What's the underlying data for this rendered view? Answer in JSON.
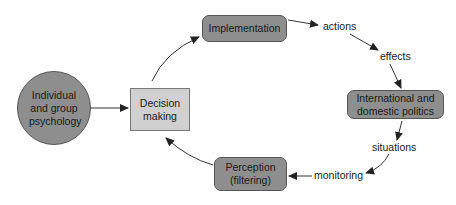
{
  "diagram": {
    "nodes": {
      "psychology": {
        "label": "Individual and group psychology",
        "shape": "circle"
      },
      "decision": {
        "label": "Decision making",
        "shape": "square"
      },
      "implementation": {
        "label": "Implementation",
        "shape": "rounded-rect"
      },
      "politics": {
        "label": "International and domestic politics",
        "shape": "rounded-rect"
      },
      "perception": {
        "label": "Perception (filtering)",
        "shape": "rounded-rect"
      }
    },
    "edge_labels": {
      "actions": "actions",
      "effects": "effects",
      "situations": "situations",
      "monitoring": "monitoring"
    },
    "colors": {
      "dark_fill": "#8e8e8e",
      "light_fill": "#d0d0d0",
      "stroke": "#555555",
      "arrow": "#222222"
    }
  }
}
